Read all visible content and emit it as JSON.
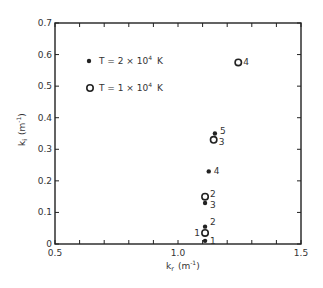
{
  "chart_data": {
    "type": "scatter",
    "title": "",
    "xlabel": "k_r (m^-1)",
    "ylabel": "k_i (m^-1)",
    "xlim": [
      0.5,
      1.5
    ],
    "ylim": [
      0,
      0.7
    ],
    "x_ticks": [
      0.5,
      0.6,
      0.7,
      0.8,
      0.9,
      1.0,
      1.1,
      1.2,
      1.3,
      1.4,
      1.5
    ],
    "x_tick_labels": [
      "0.5",
      "",
      "",
      "",
      "",
      "1.0",
      "",
      "",
      "",
      "",
      "1.5"
    ],
    "y_ticks": [
      0,
      0.1,
      0.2,
      0.3,
      0.4,
      0.5,
      0.6,
      0.7
    ],
    "y_tick_labels": [
      "0",
      "0.1",
      "0.2",
      "0.3",
      "0.4",
      "0.5",
      "0.6",
      "0.7"
    ],
    "grid": false,
    "legend_position": "upper-left",
    "series": [
      {
        "name": "T = 2 × 10^4 K",
        "marker": "filled-circle",
        "points": [
          {
            "x": 1.11,
            "y": 0.01,
            "label": "1"
          },
          {
            "x": 1.11,
            "y": 0.055,
            "label": "2"
          },
          {
            "x": 1.11,
            "y": 0.13,
            "label": "3"
          },
          {
            "x": 1.125,
            "y": 0.23,
            "label": "4"
          },
          {
            "x": 1.15,
            "y": 0.35,
            "label": "5"
          }
        ]
      },
      {
        "name": "T = 1 × 10^4 K",
        "marker": "open-circle",
        "points": [
          {
            "x": 1.11,
            "y": 0.035,
            "label": "1"
          },
          {
            "x": 1.11,
            "y": 0.15,
            "label": "2"
          },
          {
            "x": 1.145,
            "y": 0.33,
            "label": "3"
          },
          {
            "x": 1.245,
            "y": 0.575,
            "label": "4"
          }
        ]
      }
    ]
  },
  "legend": {
    "items": [
      {
        "marker": "filled-circle",
        "text_main": "T = 2 × 10",
        "text_exp": "4",
        "text_unit": "K"
      },
      {
        "marker": "open-circle",
        "text_main": "T = 1 × 10",
        "text_exp": "4",
        "text_unit": "K"
      }
    ]
  },
  "axes": {
    "x_label_main": "k",
    "x_label_sub": "r",
    "x_label_unit": "(m",
    "x_label_exp": "-1",
    "x_label_close": ")",
    "y_label_main": "k",
    "y_label_sub": "i",
    "y_label_unit": "(m",
    "y_label_exp": "-1",
    "y_label_close": ")"
  }
}
